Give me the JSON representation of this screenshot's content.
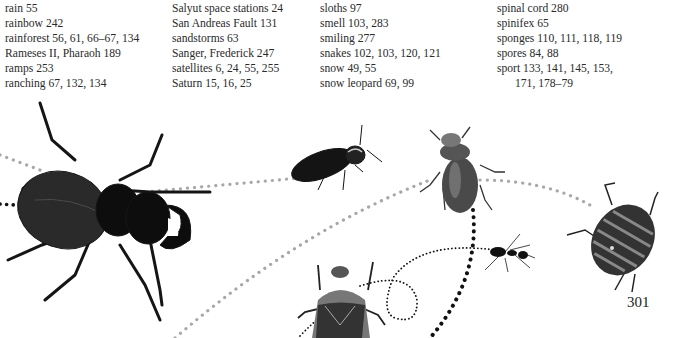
{
  "index": {
    "columns": [
      {
        "entries": [
          {
            "text": "rain 55"
          },
          {
            "text": "rainbow 242"
          },
          {
            "text": "rainforest 56, 61, 66–67, 134"
          },
          {
            "text": "Rameses II, Pharaoh 189"
          },
          {
            "text": "ramps 253"
          },
          {
            "text": "ranching 67, 132, 134"
          }
        ]
      },
      {
        "entries": [
          {
            "text": "Salyut space stations 24"
          },
          {
            "text": "San Andreas Fault 131"
          },
          {
            "text": "sandstorms 63"
          },
          {
            "text": "Sanger, Frederick 247"
          },
          {
            "text": "satellites 6, 24, 55, 255"
          },
          {
            "text": "Saturn 15, 16, 25"
          }
        ]
      },
      {
        "entries": [
          {
            "text": "sloths 97"
          },
          {
            "text": "smell 103, 283"
          },
          {
            "text": "smiling 277"
          },
          {
            "text": "snakes 102, 103, 120, 121"
          },
          {
            "text": "snow 49, 55"
          },
          {
            "text": "snow leopard 69, 99"
          }
        ]
      },
      {
        "entries": [
          {
            "text": "spinal cord 280"
          },
          {
            "text": "spinifex 65"
          },
          {
            "text": "sponges 110, 111, 118, 119"
          },
          {
            "text": "spores 84, 88"
          },
          {
            "text": "sport 133, 141, 145, 153,"
          },
          {
            "text": "171, 178–79",
            "continuation": true
          }
        ]
      }
    ]
  },
  "page_number": "301",
  "illustration": {
    "subjects": [
      "stag-beetle",
      "click-beetle",
      "small-stag-beetle",
      "striped-shield-bug",
      "chafer-beetle",
      "ant"
    ],
    "colors": {
      "dots_grey": "#a8a8a8",
      "dots_black": "#111111",
      "beetle_dark": "#1a1a1a"
    }
  }
}
